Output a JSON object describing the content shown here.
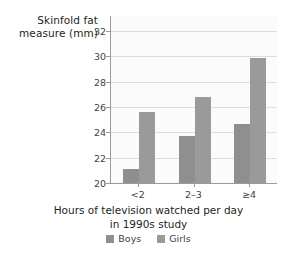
{
  "chart_data": {
    "type": "bar",
    "title": "",
    "categories": [
      "<2",
      "2–3",
      "≥4"
    ],
    "series": [
      {
        "name": "Boys",
        "values": [
          21.1,
          23.7,
          24.7
        ],
        "color": "#8f8f8f"
      },
      {
        "name": "Girls",
        "values": [
          25.6,
          26.8,
          29.9
        ],
        "color": "#9a9a9a"
      }
    ],
    "ylabel": "Skinfold fat measure (mm)",
    "ylabel_lines": [
      "Skinfold fat",
      "measure (mm)"
    ],
    "xlabel": "Hours of television watched per day in 1990s study",
    "xlabel_lines": [
      "Hours of television watched per day",
      "in 1990s study"
    ],
    "ylim": [
      20,
      33.2
    ],
    "yticks": [
      20,
      22,
      24,
      26,
      28,
      30,
      32
    ],
    "ytick_labels": [
      "20",
      "22",
      "24",
      "26",
      "28",
      "30",
      "32"
    ],
    "grid": "horizontal",
    "legend_position": "bottom-center",
    "legend_entries": [
      "Boys",
      "Girls"
    ]
  },
  "axes": {
    "y_title_line1": "Skinfold fat",
    "y_title_line2": "measure (mm)",
    "x_title_line1": "Hours of television watched per day",
    "x_title_line2": "in 1990s study"
  },
  "legend": {
    "boys_label": "Boys",
    "girls_label": "Girls"
  },
  "colors": {
    "boys": "#8f8f8f",
    "girls": "#9a9a9a",
    "grid": "#dcdcdc",
    "axis": "#9b9b9b",
    "plot_background": "#fbfbfb",
    "text": "#231f20"
  }
}
